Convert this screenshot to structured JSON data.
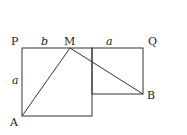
{
  "diagram": {
    "points": {
      "P": {
        "label": "P",
        "x": 22,
        "y": 48
      },
      "M": {
        "label": "M",
        "x": 70,
        "y": 48
      },
      "Q": {
        "label": "Q",
        "x": 143,
        "y": 48
      },
      "A": {
        "label": "A",
        "x": 22,
        "y": 116
      },
      "B": {
        "label": "B",
        "x": 143,
        "y": 94
      }
    },
    "segment_labels": {
      "PM": "b",
      "MQ": "a",
      "PA": "a"
    },
    "stroke_color": "#333333"
  }
}
